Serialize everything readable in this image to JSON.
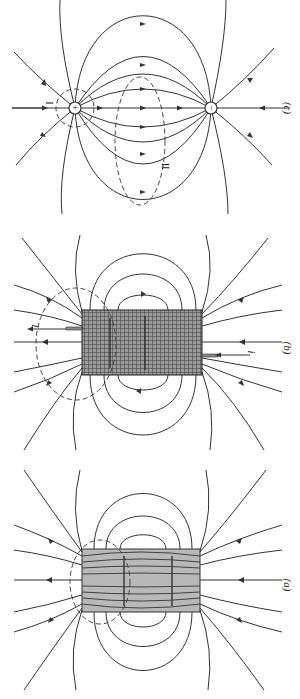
{
  "figure": {
    "panels": [
      {
        "id": "c",
        "label": "(c)",
        "subject": "electric dipole field lines",
        "charges": [
          {
            "sign": "+",
            "symbol": "+"
          },
          {
            "sign": "-",
            "symbol": "−"
          }
        ],
        "regions": [
          {
            "label": "I"
          },
          {
            "label": "II"
          }
        ]
      },
      {
        "id": "b",
        "label": "(b)",
        "subject": "solenoid field lines",
        "current_labels": [
          "i",
          "i"
        ]
      },
      {
        "id": "a",
        "label": "(a)",
        "subject": "bar magnet field lines"
      }
    ]
  },
  "colors": {
    "line": "#333333",
    "magnet_fill": "#b8b8b8",
    "solenoid_fill": "#8c8c8c",
    "background": "#ffffff"
  }
}
